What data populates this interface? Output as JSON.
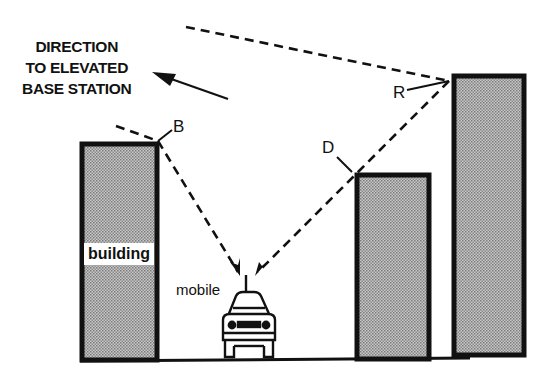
{
  "diagram": {
    "direction_label": [
      "DIRECTION",
      "TO ELEVATED",
      "BASE STATION"
    ],
    "points": {
      "B": "B",
      "D": "D",
      "R": "R"
    },
    "building_label": "building",
    "mobile_label": "mobile",
    "colors": {
      "line": "#111111",
      "fill": "#a8a8a8",
      "background": "#ffffff"
    }
  }
}
